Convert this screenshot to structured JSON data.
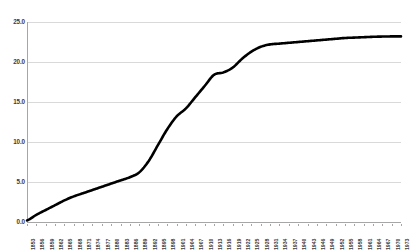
{
  "chart_data": {
    "type": "line",
    "title": "",
    "subtitle": "",
    "xlabel": "",
    "ylabel": "",
    "ylim": [
      0.0,
      25.0
    ],
    "xlim": [
      1853,
      1973
    ],
    "grid": true,
    "legend": false,
    "legend_position": "none",
    "series_color": "#000000",
    "ytick_labels": [
      "25.0",
      "20.0",
      "15.0",
      "10.0",
      "5.0",
      "0.0"
    ],
    "ytick_values": [
      25.0,
      20.0,
      15.0,
      10.0,
      5.0,
      0.0
    ],
    "xtick_labels": [
      "1853",
      "1856",
      "1859",
      "1862",
      "1865",
      "1868",
      "1871",
      "1874",
      "1877",
      "1880",
      "1883",
      "1886",
      "1889",
      "1892",
      "1895",
      "1898",
      "1901",
      "1904",
      "1907",
      "1910",
      "1913",
      "1916",
      "1919",
      "1922",
      "1925",
      "1928",
      "1931",
      "1934",
      "1937",
      "1940",
      "1943",
      "1946",
      "1949",
      "1952",
      "1955",
      "1958",
      "1961",
      "1964",
      "1967",
      "1970",
      "1973"
    ],
    "x": [
      1853,
      1856,
      1859,
      1862,
      1865,
      1868,
      1871,
      1874,
      1877,
      1880,
      1883,
      1886,
      1889,
      1892,
      1895,
      1898,
      1901,
      1904,
      1907,
      1910,
      1913,
      1916,
      1919,
      1922,
      1925,
      1928,
      1931,
      1934,
      1937,
      1940,
      1943,
      1946,
      1949,
      1952,
      1955,
      1958,
      1961,
      1964,
      1967,
      1970,
      1973
    ],
    "values": [
      0.2,
      0.9,
      1.5,
      2.1,
      2.7,
      3.2,
      3.6,
      4.0,
      4.4,
      4.8,
      5.2,
      5.6,
      6.2,
      7.6,
      9.6,
      11.6,
      13.2,
      14.2,
      15.6,
      17.0,
      18.4,
      18.7,
      19.3,
      20.4,
      21.3,
      21.9,
      22.2,
      22.3,
      22.4,
      22.5,
      22.6,
      22.7,
      22.8,
      22.9,
      23.0,
      23.05,
      23.1,
      23.15,
      23.18,
      23.2,
      23.2
    ]
  }
}
